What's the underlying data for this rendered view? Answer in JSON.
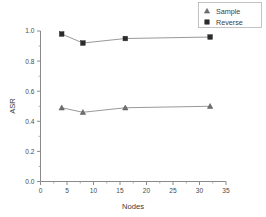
{
  "chart_data": {
    "type": "line",
    "title": "",
    "xlabel": "Nodes",
    "ylabel": "ASR",
    "xlim": [
      0,
      35
    ],
    "ylim": [
      0.0,
      1.0
    ],
    "grid": false,
    "legend_position": "top-right",
    "x": [
      4,
      8,
      16,
      32
    ],
    "xticks": [
      "0",
      "5",
      "10",
      "15",
      "20",
      "25",
      "30",
      "35"
    ],
    "xtick_values": [
      0,
      5,
      10,
      15,
      20,
      25,
      30,
      35
    ],
    "yticks": [
      "0.0",
      "0.2",
      "0.4",
      "0.6",
      "0.8",
      "1.0"
    ],
    "ytick_values": [
      0.0,
      0.2,
      0.4,
      0.6,
      0.8,
      1.0
    ],
    "series": [
      {
        "name": "Sample",
        "marker": "triangle",
        "color": "#6f6f6f",
        "values": [
          0.49,
          0.46,
          0.49,
          0.5
        ]
      },
      {
        "name": "Reverse",
        "marker": "square",
        "color": "#2b2b2b",
        "values": [
          0.98,
          0.92,
          0.95,
          0.96
        ]
      }
    ]
  },
  "legend": {
    "entries": [
      {
        "label": "Sample",
        "marker": "triangle-marker-icon"
      },
      {
        "label": "Reverse",
        "marker": "square-marker-icon"
      }
    ]
  },
  "axes": {
    "x_title": "Nodes",
    "y_title": "ASR"
  }
}
